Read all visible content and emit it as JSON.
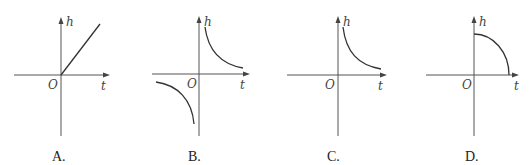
{
  "figure": {
    "axis_labels": {
      "vertical": "h",
      "horizontal": "t",
      "origin": "O"
    },
    "options": [
      {
        "id": "A",
        "label": "A.",
        "description": "straight line through origin, increasing"
      },
      {
        "id": "B",
        "label": "B.",
        "description": "hyperbola in first and third quadrants"
      },
      {
        "id": "C",
        "label": "C.",
        "description": "decreasing hyperbola branch in first quadrant"
      },
      {
        "id": "D",
        "label": "D.",
        "description": "quarter arc from h-axis down to t-axis"
      }
    ]
  },
  "colors": {
    "axis": "#555555",
    "curve": "#333333",
    "text": "#222222"
  }
}
